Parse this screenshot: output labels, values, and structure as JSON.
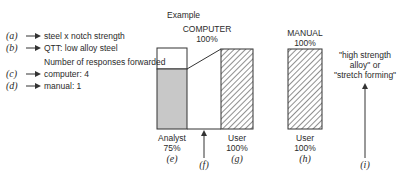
{
  "legend": {
    "a": {
      "tag": "(a)",
      "text": "steel x notch strength"
    },
    "b": {
      "tag": "(b)",
      "text": "QTT: low alloy steel"
    },
    "heading": "Number of responses forwarded",
    "c": {
      "tag": "(c)",
      "text": "computer: 4"
    },
    "d": {
      "tag": "(d)",
      "text": "manual: 1"
    }
  },
  "diagram": {
    "title": "Example",
    "computer": {
      "label": "COMPUTER",
      "pct": "100%"
    },
    "manual": {
      "label": "MANUAL",
      "pct": "100%"
    },
    "analyst": {
      "label": "Analyst",
      "pct": "75%",
      "tag": "(e)"
    },
    "f": {
      "tag": "(f)"
    },
    "user_g": {
      "label": "User",
      "pct": "100%",
      "tag": "(g)"
    },
    "user_h": {
      "label": "User",
      "pct": "100%",
      "tag": "(h)"
    },
    "i": {
      "tag": "(i)",
      "quote_line1": "\"high strength",
      "quote_line2": "alloy\" or",
      "quote_line3": "\"stretch forming\""
    }
  },
  "colors": {
    "shade": "#c8c8c8",
    "stroke": "#333333"
  }
}
